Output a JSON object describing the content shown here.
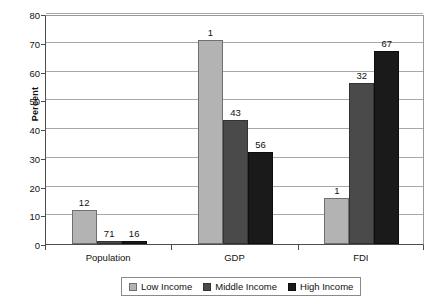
{
  "chart_data": {
    "type": "bar",
    "title": "",
    "subtitle": "",
    "xlabel": "",
    "ylabel": "Percent",
    "categories": [
      "Population",
      "GDP",
      "FDI"
    ],
    "series": [
      {
        "name": "Low Income",
        "values": [
          12,
          71,
          16
        ],
        "color": "#b3b3b3"
      },
      {
        "name": "Middle Income",
        "values": [
          1,
          43,
          56
        ],
        "color": "#4a4a4a"
      },
      {
        "name": "High Income",
        "values": [
          1,
          32,
          67
        ],
        "color": "#1a1a1a"
      }
    ],
    "series_by_category": {
      "Population": {
        "Low Income": 12,
        "Middle Income": 71,
        "High Income": 16
      },
      "GDP": {
        "Low Income": 1,
        "Middle Income": 43,
        "High Income": 56
      },
      "FDI": {
        "Low Income": 1,
        "Middle Income": 32,
        "High Income": 67
      }
    },
    "ylim": [
      0,
      80
    ],
    "ytick_step": 10,
    "yticks": [
      0,
      10,
      20,
      30,
      40,
      50,
      60,
      70,
      80
    ],
    "ytick_labels": [
      "0",
      "10",
      "20",
      "30",
      "40",
      "50",
      "60",
      "70",
      "80"
    ],
    "grid": "horizontal",
    "legend_position": "bottom",
    "data_labels": true,
    "data_label_values": [
      [
        "12",
        "71",
        "16"
      ],
      [
        "1",
        "43",
        "56"
      ],
      [
        "1",
        "32",
        "67"
      ]
    ]
  },
  "axis": {
    "y_title": "Percent",
    "y_tick_labels": [
      "80",
      "70",
      "60",
      "50",
      "40",
      "30",
      "20",
      "10",
      "0"
    ],
    "x_tick_labels": [
      "Population",
      "GDP",
      "FDI"
    ]
  },
  "legend": {
    "items": [
      {
        "label": "Low Income",
        "color": "#b3b3b3"
      },
      {
        "label": "Middle Income",
        "color": "#4a4a4a"
      },
      {
        "label": "High Income",
        "color": "#1a1a1a"
      }
    ]
  }
}
